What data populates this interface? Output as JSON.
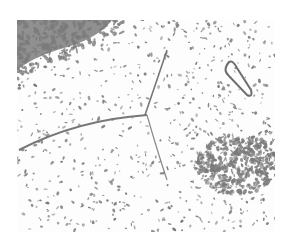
{
  "image": {
    "description": "Grayscale micrograph-like image with scattered dark gray speckles on white background, dense cluster in upper-left and lower-right, thin curved filament lines and a loop shape at right",
    "colors": {
      "background": "#ffffff",
      "speckle": "#7a7a7a",
      "dense": "#6e6e6e"
    }
  }
}
